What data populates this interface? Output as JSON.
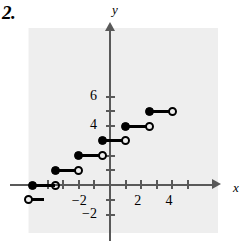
{
  "problem": {
    "number": "2."
  },
  "chart_data": {
    "type": "line",
    "title": "",
    "subtitle": "",
    "xlabel": "x",
    "ylabel": "y",
    "grid": false,
    "legend": "none",
    "xlim": [
      -5.3,
      5.6
    ],
    "ylim": [
      -2.6,
      7.0
    ],
    "xticks": [
      -4,
      -3,
      -2,
      -1,
      1,
      2,
      3,
      4,
      5
    ],
    "xtick_labels": [
      {
        "value": -2,
        "label": "−2"
      },
      {
        "value": 2,
        "label": "2"
      },
      {
        "value": 4,
        "label": "4"
      }
    ],
    "yticks": [
      -2,
      -1,
      1,
      2,
      3,
      4,
      5,
      6
    ],
    "ytick_labels": [
      {
        "value": 6,
        "label": "6"
      },
      {
        "value": 4,
        "label": "4"
      },
      {
        "value": -2,
        "label": "−2"
      }
    ],
    "series": [
      {
        "name": "step-function",
        "segments": [
          {
            "x_start": -5.2,
            "x_end": -4.2,
            "y": -1,
            "left_endpoint": "open",
            "right_endpoint": "none"
          },
          {
            "x_start": -5.0,
            "x_end": -3.5,
            "y": 0,
            "left_endpoint": "closed",
            "right_endpoint": "open"
          },
          {
            "x_start": -3.5,
            "x_end": -2.0,
            "y": 1,
            "left_endpoint": "closed",
            "right_endpoint": "open"
          },
          {
            "x_start": -2.0,
            "x_end": -0.5,
            "y": 2,
            "left_endpoint": "closed",
            "right_endpoint": "open"
          },
          {
            "x_start": -0.5,
            "x_end": 1.0,
            "y": 3,
            "left_endpoint": "closed",
            "right_endpoint": "open"
          },
          {
            "x_start": 1.0,
            "x_end": 2.5,
            "y": 4,
            "left_endpoint": "closed",
            "right_endpoint": "open"
          },
          {
            "x_start": 2.5,
            "x_end": 4.0,
            "y": 5,
            "left_endpoint": "closed",
            "right_endpoint": "open"
          }
        ]
      }
    ],
    "colors": {
      "ink": "#000000",
      "axis": "#595959",
      "panel": "#eeeeee"
    }
  }
}
